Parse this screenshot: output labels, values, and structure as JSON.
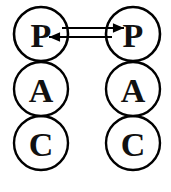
{
  "diagram": {
    "type": "node-link",
    "background_color": "#ffffff",
    "stroke_color": "#000000",
    "label_color": "#111111",
    "canvas": {
      "width": 171,
      "height": 192
    },
    "columns": [
      {
        "id": "left-agent",
        "name": "left-pac-agent",
        "center_x": 41,
        "nodes": [
          {
            "id": "left-p",
            "label": "P",
            "role": "presentation",
            "cx": 41,
            "cy": 34,
            "r": 27,
            "stroke_width": 2.6,
            "font_size": 36
          },
          {
            "id": "left-a",
            "label": "A",
            "role": "abstraction",
            "cx": 41,
            "cy": 89,
            "r": 27,
            "stroke_width": 2.4,
            "font_size": 33
          },
          {
            "id": "left-c",
            "label": "C",
            "role": "control",
            "cx": 41,
            "cy": 143,
            "r": 27,
            "stroke_width": 2.4,
            "font_size": 33
          }
        ]
      },
      {
        "id": "right-agent",
        "name": "right-pac-agent",
        "center_x": 133,
        "nodes": [
          {
            "id": "right-p",
            "label": "P",
            "role": "presentation",
            "cx": 133,
            "cy": 34,
            "r": 27,
            "stroke_width": 2.6,
            "font_size": 36
          },
          {
            "id": "right-a",
            "label": "A",
            "role": "abstraction",
            "cx": 133,
            "cy": 89,
            "r": 27,
            "stroke_width": 2.4,
            "font_size": 33
          },
          {
            "id": "right-c",
            "label": "C",
            "role": "control",
            "cx": 133,
            "cy": 143,
            "r": 27,
            "stroke_width": 2.4,
            "font_size": 33
          }
        ]
      }
    ],
    "connections": [
      {
        "id": "p-to-p-forward",
        "name": "arrow-left-p-to-right-p",
        "direction": "right",
        "from": "left-p",
        "to": "right-p",
        "x1": 62,
        "x2": 124,
        "y": 28,
        "arrow_tip_x": 124,
        "arrow_size": 6.5
      },
      {
        "id": "p-to-p-reverse",
        "name": "arrow-right-p-to-left-p",
        "direction": "left",
        "from": "right-p",
        "to": "left-p",
        "x1": 112,
        "x2": 49,
        "y": 37,
        "arrow_tip_x": 49,
        "arrow_size": 6.5
      }
    ],
    "artifacts": [
      {
        "id": "bleed-1",
        "text": "",
        "x": 12,
        "y": 176
      },
      {
        "id": "bleed-2",
        "text": "",
        "x": 12,
        "y": 186
      }
    ]
  }
}
